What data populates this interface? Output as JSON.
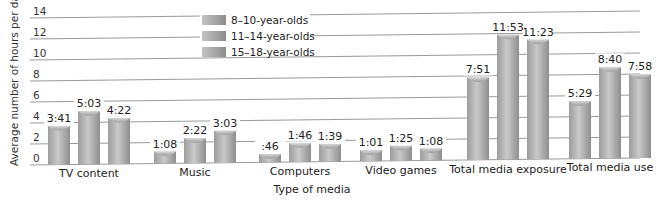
{
  "chart_data": {
    "type": "bar",
    "title": "",
    "xlabel": "Type of media",
    "ylabel": "Average number of hours per day",
    "ylim": [
      0,
      14
    ],
    "yticks": [
      0,
      2,
      4,
      6,
      8,
      10,
      12,
      14
    ],
    "grid": true,
    "legend_position": "top-center",
    "categories": [
      "TV content",
      "Music",
      "Computers",
      "Video games",
      "Total media exposure",
      "Total media use"
    ],
    "series": [
      {
        "name": "8–10-year-olds",
        "labels": [
          "3:41",
          "1:08",
          ":46",
          "1:01",
          "7:51",
          "5:29"
        ],
        "values": [
          3.68,
          1.13,
          0.77,
          1.02,
          7.85,
          5.48
        ]
      },
      {
        "name": "11–14-year-olds",
        "labels": [
          "5:03",
          "2:22",
          "1:46",
          "1:25",
          "11:53",
          "8:40"
        ],
        "values": [
          5.05,
          2.37,
          1.77,
          1.42,
          11.88,
          8.67
        ]
      },
      {
        "name": "15–18-year-olds",
        "labels": [
          "4:22",
          "3:03",
          "1:39",
          "1:08",
          "11:23",
          "7:58"
        ],
        "values": [
          4.37,
          3.05,
          1.65,
          1.13,
          11.38,
          7.97
        ]
      }
    ]
  },
  "legend": {
    "items": [
      "8–10-year-olds",
      "11–14-year-olds",
      "15–18-year-olds"
    ]
  },
  "colors": {
    "bar_dark": "#8a8a8a",
    "bar_light": "#c8c8c8",
    "grid": "#9a9a9a"
  }
}
